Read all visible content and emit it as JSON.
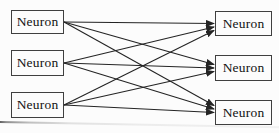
{
  "diagram": {
    "type": "graph",
    "colors": {
      "background": "#fcfcfc",
      "stroke": "#242424",
      "box_border": "#3f3f3f",
      "text": "#111111"
    },
    "nodes": [
      {
        "id": "L1",
        "label": "Neuron",
        "x": 11,
        "y": 10,
        "w": 53,
        "h": 24
      },
      {
        "id": "L2",
        "label": "Neuron",
        "x": 11,
        "y": 50,
        "w": 53,
        "h": 26
      },
      {
        "id": "L3",
        "label": "Neuron",
        "x": 11,
        "y": 92,
        "w": 53,
        "h": 26
      },
      {
        "id": "R1",
        "label": "Neuron",
        "x": 215,
        "y": 11,
        "w": 57,
        "h": 25
      },
      {
        "id": "R2",
        "label": "Neuron",
        "x": 215,
        "y": 55,
        "w": 57,
        "h": 26
      },
      {
        "id": "R3",
        "label": "Neuron",
        "x": 215,
        "y": 100,
        "w": 57,
        "h": 25
      }
    ],
    "edges": [
      {
        "from": "L1",
        "to": "R1"
      },
      {
        "from": "L1",
        "to": "R2"
      },
      {
        "from": "L1",
        "to": "R3"
      },
      {
        "from": "L2",
        "to": "R1"
      },
      {
        "from": "L2",
        "to": "R2"
      },
      {
        "from": "L2",
        "to": "R3"
      },
      {
        "from": "L3",
        "to": "R1"
      },
      {
        "from": "L3",
        "to": "R2"
      },
      {
        "from": "L3",
        "to": "R3"
      }
    ]
  }
}
